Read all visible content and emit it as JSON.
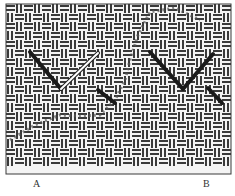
{
  "figure": {
    "type": "needlework-stitch-diagram",
    "canvas": {
      "x": 6,
      "y": 4,
      "width": 225,
      "height": 170,
      "cell": 9,
      "thread_color": "#3a3a3a",
      "hole_color": "#f4f4f4"
    },
    "stitches": [
      {
        "id": "A",
        "dark_segments": [
          {
            "x1": 30,
            "y1": 52,
            "x2": 61,
            "y2": 89
          },
          {
            "x1": 98,
            "y1": 90,
            "x2": 115,
            "y2": 103
          }
        ],
        "light_segments": [
          {
            "x1": 61,
            "y1": 89,
            "x2": 98,
            "y2": 53
          }
        ]
      },
      {
        "id": "B",
        "dark_segments": [
          {
            "x1": 150,
            "y1": 52,
            "x2": 183,
            "y2": 89
          },
          {
            "x1": 183,
            "y1": 89,
            "x2": 213,
            "y2": 54
          },
          {
            "x1": 208,
            "y1": 88,
            "x2": 222,
            "y2": 103
          }
        ],
        "light_segments": []
      }
    ],
    "trail_points": [
      [
        10,
        140
      ],
      [
        35,
        125
      ],
      [
        60,
        115
      ],
      [
        80,
        116
      ],
      [
        100,
        115
      ],
      [
        115,
        100
      ],
      [
        125,
        80
      ],
      [
        130,
        60
      ],
      [
        138,
        35
      ],
      [
        150,
        12
      ],
      [
        175,
        8
      ],
      [
        200,
        20
      ]
    ],
    "colors": {
      "dark_thread": "#1a1a1a",
      "light_thread": "#ffffff",
      "trail": "#555555"
    }
  },
  "labels": {
    "a": "A",
    "b": "B"
  },
  "caption": ""
}
